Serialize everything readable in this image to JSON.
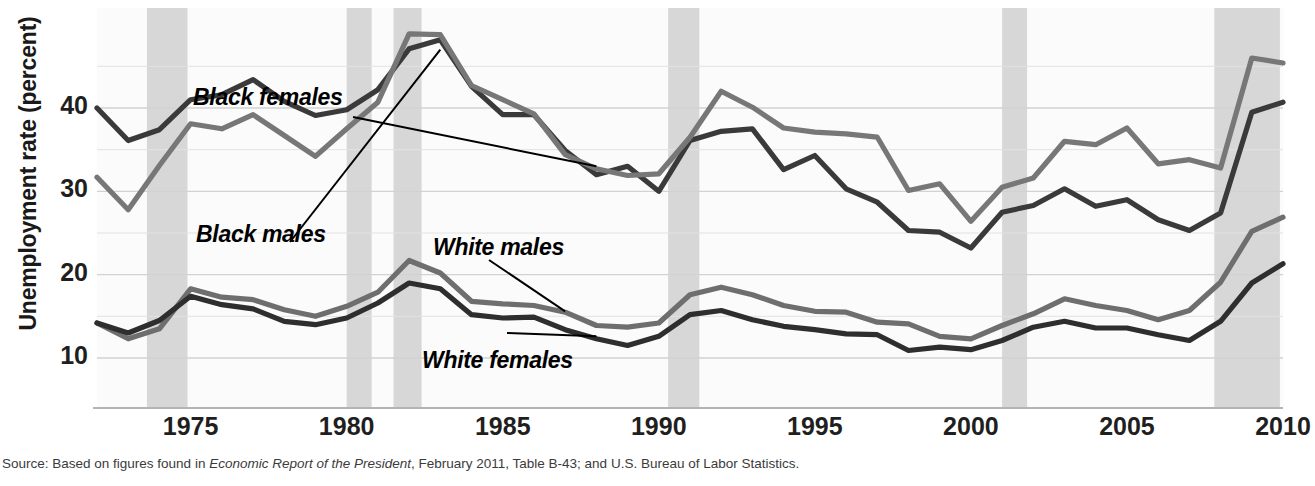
{
  "figure": {
    "ylabel": "Unemployment rate (percent)",
    "source_prefix": "Source: Based on figures found in ",
    "source_italic": "Economic Report of the President",
    "source_suffix": ", February 2011, Table B-43; and U.S. Bureau of Labor Statistics."
  },
  "chart_data": {
    "type": "line",
    "title": "",
    "xlabel": "",
    "ylabel": "Unemployment rate (percent)",
    "xlim": [
      1972,
      2010
    ],
    "ylim": [
      4,
      52
    ],
    "xticks": [
      1975,
      1980,
      1985,
      1990,
      1995,
      2000,
      2005,
      2010
    ],
    "xticklabels": [
      "1975",
      "1980",
      "1985",
      "1990",
      "1995",
      "2000",
      "2005",
      "2010"
    ],
    "yticks": [
      10,
      20,
      30,
      40
    ],
    "yticklabels": [
      "10",
      "20",
      "30",
      "40"
    ],
    "grid": true,
    "legend_position": "inline-annotations",
    "x": [
      1972,
      1973,
      1974,
      1975,
      1976,
      1977,
      1978,
      1979,
      1980,
      1981,
      1982,
      1983,
      1984,
      1985,
      1986,
      1987,
      1988,
      1989,
      1990,
      1991,
      1992,
      1993,
      1994,
      1995,
      1996,
      1997,
      1998,
      1999,
      2000,
      2001,
      2002,
      2003,
      2004,
      2005,
      2006,
      2007,
      2008,
      2009,
      2010
    ],
    "series": [
      {
        "name": "Black females",
        "color": "#3a3a3a",
        "values": [
          40.0,
          36.1,
          37.4,
          41.0,
          41.6,
          43.4,
          40.8,
          39.1,
          39.8,
          42.2,
          47.1,
          48.2,
          42.6,
          39.2,
          39.2,
          34.9,
          32.0,
          33.0,
          30.0,
          36.1,
          37.2,
          37.5,
          32.6,
          34.3,
          30.3,
          28.7,
          25.3,
          25.1,
          23.2,
          27.5,
          28.3,
          30.3,
          28.2,
          29.0,
          26.6,
          25.3,
          27.4,
          39.5,
          40.7
        ]
      },
      {
        "name": "Black males",
        "color": "#777777",
        "values": [
          31.7,
          27.8,
          33.1,
          38.1,
          37.5,
          39.2,
          36.7,
          34.2,
          37.5,
          40.7,
          48.9,
          48.8,
          42.7,
          41.0,
          39.3,
          34.4,
          32.7,
          31.9,
          32.1,
          36.5,
          42.0,
          40.1,
          37.6,
          37.1,
          36.9,
          36.5,
          30.1,
          30.9,
          26.4,
          30.5,
          31.6,
          36.0,
          35.6,
          37.6,
          33.3,
          33.8,
          32.8,
          46.0,
          45.4
        ]
      },
      {
        "name": "White males",
        "color": "#6e6e6e",
        "values": [
          14.2,
          12.3,
          13.5,
          18.3,
          17.3,
          17.0,
          15.8,
          15.0,
          16.2,
          17.9,
          21.7,
          20.2,
          16.8,
          16.5,
          16.3,
          15.5,
          13.9,
          13.7,
          14.2,
          17.6,
          18.5,
          17.6,
          16.3,
          15.6,
          15.5,
          14.3,
          14.1,
          12.6,
          12.3,
          13.9,
          15.3,
          17.1,
          16.3,
          15.7,
          14.6,
          15.7,
          19.1,
          25.2,
          26.9
        ]
      },
      {
        "name": "White females",
        "color": "#2e2e2e",
        "values": [
          14.2,
          13.0,
          14.5,
          17.4,
          16.4,
          15.9,
          14.4,
          14.0,
          14.8,
          16.6,
          19.0,
          18.3,
          15.2,
          14.8,
          14.9,
          13.4,
          12.3,
          11.5,
          12.6,
          15.2,
          15.7,
          14.6,
          13.8,
          13.4,
          12.9,
          12.8,
          10.9,
          11.3,
          11.0,
          12.1,
          13.7,
          14.4,
          13.6,
          13.6,
          12.8,
          12.1,
          14.4,
          19.0,
          21.3
        ]
      }
    ],
    "annotations": [
      {
        "label": "Black females",
        "pointer_to_year": 1988,
        "pointer_to_value": 33.0
      },
      {
        "label": "Black males",
        "pointer_to_year": 1983,
        "pointer_to_value": 47.0
      },
      {
        "label": "White males",
        "pointer_to_year": 1987,
        "pointer_to_value": 15.6
      },
      {
        "label": "White females",
        "pointer_to_year": 1988,
        "pointer_to_value": 12.6
      }
    ],
    "recession_bands": [
      {
        "start": 1973.6,
        "end": 1974.9
      },
      {
        "start": 1980.0,
        "end": 1980.8
      },
      {
        "start": 1981.5,
        "end": 1982.4
      },
      {
        "start": 1990.3,
        "end": 1991.3
      },
      {
        "start": 2001.0,
        "end": 2001.8
      },
      {
        "start": 2007.8,
        "end": 2009.9
      }
    ]
  }
}
